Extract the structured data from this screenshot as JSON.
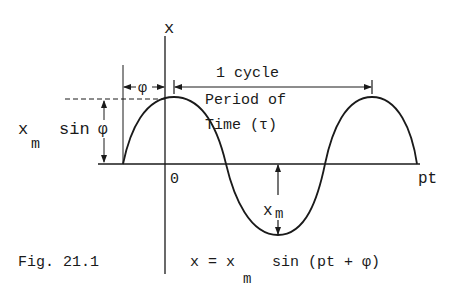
{
  "figure": {
    "caption": "Fig. 21.1",
    "equation": {
      "lhs": "x = x",
      "subscript": "m",
      "rhs": "sin (pt + φ)"
    }
  },
  "axes": {
    "vertical_label": "x",
    "horizontal_label": "pt",
    "origin_label": "0"
  },
  "annotations": {
    "phase_label": "φ",
    "cycle_label": "1 cycle",
    "period_line1": "Period of",
    "period_line2": "Time (τ)",
    "offset_label_main": "x",
    "offset_label_sub": "m",
    "offset_label_func": "sin",
    "offset_label_phi": "φ",
    "amplitude_label_main": "x",
    "amplitude_label_sub": "m"
  },
  "colors": {
    "ink": "#1a1a1a",
    "background": "#ffffff"
  }
}
